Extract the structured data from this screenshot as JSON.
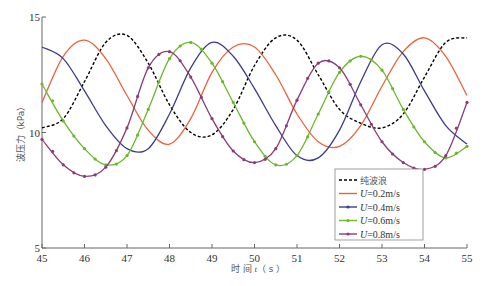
{
  "chart_data": {
    "type": "line",
    "title": "",
    "xlabel": "时间 t（s）",
    "ylabel": "波压力（kPa）",
    "xlim": [
      45,
      55
    ],
    "ylim": [
      5,
      15
    ],
    "x_ticks": [
      45,
      46,
      47,
      48,
      49,
      50,
      51,
      52,
      53,
      54,
      55
    ],
    "y_ticks": [
      5,
      10,
      15
    ],
    "grid": false,
    "legend_position": "lower-right-inside",
    "x": [
      45,
      45.5,
      46,
      46.5,
      47,
      47.5,
      48,
      48.5,
      49,
      49.5,
      50,
      50.5,
      51,
      51.5,
      52,
      52.5,
      53,
      53.5,
      54,
      54.5,
      55
    ],
    "series": [
      {
        "name": "纯波浪",
        "color": "#000000",
        "style": "dashed",
        "values": [
          10.2,
          10.6,
          12.2,
          13.9,
          14.2,
          13.0,
          11.2,
          10.0,
          9.9,
          11.0,
          12.9,
          14.1,
          14.0,
          12.5,
          11.0,
          10.4,
          10.2,
          10.8,
          12.4,
          13.9,
          14.1
        ]
      },
      {
        "name": "U=0.2m/s",
        "color": "#e8643c",
        "style": "solid",
        "values": [
          11.3,
          13.3,
          14.0,
          13.2,
          11.6,
          10.1,
          9.5,
          10.6,
          12.6,
          13.7,
          13.7,
          12.5,
          10.8,
          9.6,
          9.4,
          10.3,
          12.0,
          13.5,
          14.1,
          13.3,
          11.6
        ]
      },
      {
        "name": "U=0.4m/s",
        "color": "#3c3c8c",
        "style": "solid",
        "values": [
          13.7,
          13.2,
          11.8,
          10.3,
          9.3,
          9.3,
          10.8,
          12.8,
          13.9,
          13.3,
          11.9,
          10.3,
          9.0,
          8.9,
          10.1,
          12.2,
          13.8,
          13.4,
          11.8,
          10.3,
          9.5
        ]
      },
      {
        "name": "U=0.6m/s",
        "color": "#6cb82c",
        "style": "solid-marker",
        "values": [
          12.1,
          10.5,
          9.3,
          8.6,
          9.0,
          11.0,
          13.2,
          13.9,
          13.0,
          11.3,
          9.6,
          8.6,
          9.0,
          10.8,
          12.6,
          13.3,
          12.7,
          11.0,
          9.6,
          8.9,
          9.4
        ]
      },
      {
        "name": "U=0.8m/s",
        "color": "#8c3c78",
        "style": "solid-marker",
        "values": [
          9.7,
          8.6,
          8.1,
          8.5,
          10.2,
          12.8,
          13.5,
          12.4,
          10.6,
          9.2,
          8.7,
          9.3,
          11.4,
          13.0,
          12.8,
          11.2,
          9.6,
          8.7,
          8.4,
          9.0,
          11.3
        ]
      }
    ]
  },
  "axes": {
    "xlabel_prefix": "时 间 ",
    "xlabel_var": "t",
    "xlabel_unit": "（ s ）",
    "ylabel": "波压力（kPa）"
  },
  "legend": {
    "items": [
      {
        "label": "纯波浪",
        "italic_prefix": "",
        "value": ""
      },
      {
        "label": "=0.2m/s",
        "italic_prefix": "U",
        "value": ""
      },
      {
        "label": "=0.4m/s",
        "italic_prefix": "U",
        "value": ""
      },
      {
        "label": "=0.6m/s",
        "italic_prefix": "U",
        "value": ""
      },
      {
        "label": "=0.8m/s",
        "italic_prefix": "U",
        "value": ""
      }
    ]
  }
}
